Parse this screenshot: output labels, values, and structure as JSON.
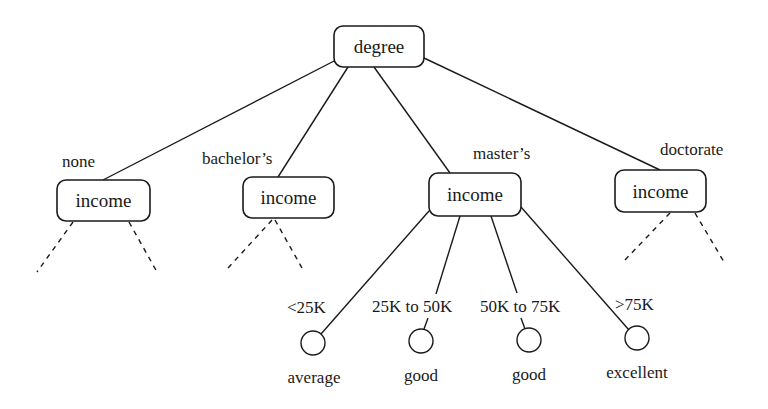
{
  "diagram": {
    "type": "decision-tree",
    "root": {
      "label": "degree",
      "box": {
        "x": 334,
        "y": 26,
        "w": 90,
        "h": 41
      }
    },
    "branches": [
      {
        "edge_label": "none",
        "edge_label_pos": {
          "x": 62,
          "y": 161
        },
        "node_label": "income",
        "box": {
          "x": 57,
          "y": 180,
          "w": 93,
          "h": 41
        },
        "edge_from": {
          "x": 336,
          "y": 60
        },
        "edge_to": {
          "x": 103,
          "y": 180
        },
        "expanded": false,
        "dashed_children": [
          {
            "x1": 73,
            "y1": 222,
            "x2": 37,
            "y2": 272
          },
          {
            "x1": 129,
            "y1": 222,
            "x2": 157,
            "y2": 272
          }
        ]
      },
      {
        "edge_label": "bachelor’s",
        "edge_label_pos": {
          "x": 202,
          "y": 158
        },
        "node_label": "income",
        "box": {
          "x": 243,
          "y": 177,
          "w": 91,
          "h": 41
        },
        "edge_from": {
          "x": 348,
          "y": 67
        },
        "edge_to": {
          "x": 278,
          "y": 177
        },
        "expanded": false,
        "dashed_children": [
          {
            "x1": 272,
            "y1": 220,
            "x2": 228,
            "y2": 268
          },
          {
            "x1": 275,
            "y1": 220,
            "x2": 302,
            "y2": 268
          }
        ]
      },
      {
        "edge_label": "master’s",
        "edge_label_pos": {
          "x": 473,
          "y": 153
        },
        "node_label": "income",
        "box": {
          "x": 429,
          "y": 173,
          "w": 92,
          "h": 43
        },
        "edge_from": {
          "x": 374,
          "y": 67
        },
        "edge_to": {
          "x": 450,
          "y": 173
        },
        "expanded": true,
        "leaves": [
          {
            "edge_label": "<25K",
            "edge_label_pos": {
              "x": 287,
              "y": 307
            },
            "leaf_label": "average",
            "circle": {
              "cx": 313,
              "cy": 343,
              "r": 12
            },
            "leaf_label_pos": {
              "x": 314,
              "y": 377
            },
            "edge_segments": [
              {
                "x1": 429,
                "y1": 211,
                "x2": 321,
                "y2": 334
              }
            ]
          },
          {
            "edge_label": "25K to 50K",
            "edge_label_pos": {
              "x": 372,
              "y": 306
            },
            "leaf_label": "good",
            "circle": {
              "cx": 421,
              "cy": 341,
              "r": 12
            },
            "leaf_label_pos": {
              "x": 421,
              "y": 375
            },
            "edge_segments": [
              {
                "x1": 460,
                "y1": 216,
                "x2": 436,
                "y2": 294
              },
              {
                "x1": 428,
                "y1": 318,
                "x2": 424,
                "y2": 329
              }
            ]
          },
          {
            "edge_label": "50K to 75K",
            "edge_label_pos": {
              "x": 480,
              "y": 306
            },
            "leaf_label": "good",
            "circle": {
              "cx": 529,
              "cy": 340,
              "r": 12
            },
            "leaf_label_pos": {
              "x": 529,
              "y": 374
            },
            "edge_segments": [
              {
                "x1": 491,
                "y1": 216,
                "x2": 517,
                "y2": 293
              },
              {
                "x1": 521,
                "y1": 318,
                "x2": 525,
                "y2": 329
              }
            ]
          },
          {
            "edge_label": ">75K",
            "edge_label_pos": {
              "x": 615,
              "y": 304
            },
            "leaf_label": "excellent",
            "circle": {
              "cx": 637,
              "cy": 338,
              "r": 12
            },
            "leaf_label_pos": {
              "x": 637,
              "y": 372
            },
            "edge_segments": [
              {
                "x1": 521,
                "y1": 207,
                "x2": 629,
                "y2": 330
              }
            ]
          }
        ]
      },
      {
        "edge_label": "doctorate",
        "edge_label_pos": {
          "x": 660,
          "y": 149
        },
        "node_label": "income",
        "box": {
          "x": 615,
          "y": 170,
          "w": 91,
          "h": 42
        },
        "edge_from": {
          "x": 424,
          "y": 58
        },
        "edge_to": {
          "x": 660,
          "y": 170
        },
        "expanded": false,
        "dashed_children": [
          {
            "x1": 670,
            "y1": 213,
            "x2": 623,
            "y2": 262
          },
          {
            "x1": 695,
            "y1": 213,
            "x2": 724,
            "y2": 262
          }
        ]
      }
    ]
  },
  "colors": {
    "ink": "#1a1a1a",
    "background": "#ffffff"
  }
}
